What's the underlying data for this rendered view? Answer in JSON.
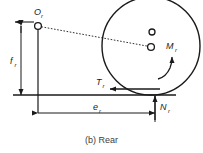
{
  "figure": {
    "caption": "(b) Rear",
    "caption_prefix": "(b)",
    "caption_text": "Rear",
    "background_color": "#ffffff",
    "line_color": "#1a1a1a",
    "caption_color": "#3d3d3d"
  },
  "labels": {
    "origin": {
      "base": "O",
      "subscript": "r",
      "full": "Or"
    },
    "moment": {
      "base": "M",
      "subscript": "r",
      "full": "Mr"
    },
    "traction": {
      "base": "T",
      "subscript": "r",
      "full": "Tr"
    },
    "normal": {
      "base": "N",
      "subscript": "r",
      "full": "Nr"
    },
    "offset_horizontal": {
      "base": "e",
      "subscript": "r",
      "full": "er"
    },
    "offset_vertical": {
      "base": "f",
      "subscript": "r",
      "full": "fr"
    }
  },
  "elements": {
    "wheel": {
      "name": "wheel-circle",
      "cx": 151,
      "cy": 46,
      "r": 49
    },
    "hub_upper": {
      "name": "hub-upper-circle",
      "cx": 152,
      "cy": 32,
      "r": 3
    },
    "hub_center": {
      "name": "hub-center-circle",
      "cx": 151,
      "cy": 47,
      "r": 3.4
    },
    "origin_node": {
      "name": "origin-node-circle",
      "cx": 38,
      "cy": 26,
      "r": 3.4
    },
    "ground_line": {
      "name": "ground-line",
      "x1": 13,
      "y1": 95,
      "x2": 175,
      "y2": 95
    },
    "rotation_arrow": {
      "name": "rotation-curved-arrow",
      "direction": "counterclockwise"
    }
  }
}
